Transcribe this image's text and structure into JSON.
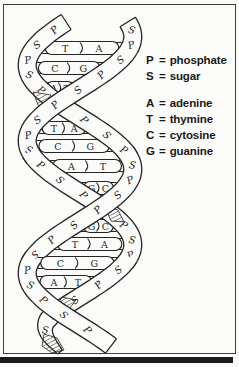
{
  "colors": {
    "ink": "#262626",
    "paper": "#fbfbf9",
    "frame": "#3f3f3f",
    "page_edge": "#1c1c1c"
  },
  "helix": {
    "base_pairs": [
      {
        "left": "T",
        "right": "A"
      },
      {
        "left": "C",
        "right": "G"
      },
      {
        "left": "A",
        "right": "T"
      },
      {
        "left": "T",
        "right": "A"
      },
      {
        "left": "C",
        "right": "G"
      },
      {
        "left": "A",
        "right": "T"
      },
      {
        "left": "G",
        "right": "C"
      },
      {
        "left": "G",
        "right": "C"
      },
      {
        "left": "T",
        "right": "A"
      },
      {
        "left": "C",
        "right": "G"
      },
      {
        "left": "A",
        "right": "T"
      }
    ],
    "backbone_labels": {
      "pattern": [
        "P",
        "S"
      ],
      "strand_a_first": "S",
      "strand_b_first": "P"
    }
  },
  "legend": {
    "separator": "=",
    "groups": [
      {
        "entries": [
          {
            "symbol": "P",
            "name": "phosphate"
          },
          {
            "symbol": "S",
            "name": "sugar"
          }
        ]
      },
      {
        "entries": [
          {
            "symbol": "A",
            "name": "adenine"
          },
          {
            "symbol": "T",
            "name": "thymine"
          },
          {
            "symbol": "C",
            "name": "cytosine"
          },
          {
            "symbol": "G",
            "name": "guanine"
          }
        ]
      }
    ]
  }
}
